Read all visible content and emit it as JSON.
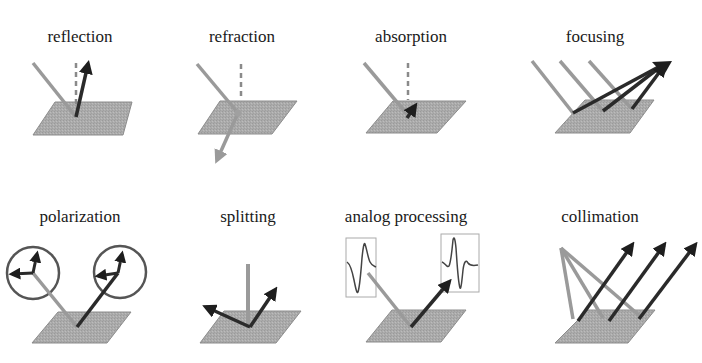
{
  "colors": {
    "background": "#ffffff",
    "plate": "#a8a8a8",
    "plate_edge": "#8c8c8c",
    "incident_ray": "#9a9a9a",
    "outgoing_ray": "#2a2a2a",
    "normal_dashed": "#8a8a8a",
    "text": "#1a1a1a"
  },
  "panels": [
    {
      "id": "reflection",
      "label": "reflection"
    },
    {
      "id": "refraction",
      "label": "refraction"
    },
    {
      "id": "absorption",
      "label": "absorption"
    },
    {
      "id": "focusing",
      "label": "focusing"
    },
    {
      "id": "polarization",
      "label": "polarization"
    },
    {
      "id": "splitting",
      "label": "splitting"
    },
    {
      "id": "analog-processing",
      "label": "analog processing"
    },
    {
      "id": "collimation",
      "label": "collimation"
    }
  ]
}
